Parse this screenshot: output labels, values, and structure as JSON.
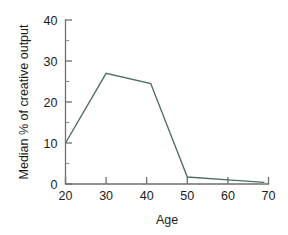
{
  "chart_data": {
    "type": "line",
    "title": "",
    "subtitle": "",
    "xlabel": "Age",
    "ylabel": "Median % of creative output",
    "xlim": [
      20,
      70
    ],
    "ylim": [
      0,
      40
    ],
    "grid": false,
    "legend": false,
    "legend_position": "none",
    "x_ticks": [
      20,
      30,
      40,
      50,
      60,
      70
    ],
    "y_ticks": [
      0,
      10,
      20,
      30,
      40
    ],
    "x_tick_labels": [
      "20",
      "30",
      "40",
      "50",
      "60",
      "70"
    ],
    "y_tick_labels": [
      "0",
      "10",
      "20",
      "30",
      "40"
    ],
    "series": [
      {
        "name": "Median % of creative output",
        "color": "#4c6d65",
        "x": [
          20,
          30,
          41,
          50,
          60,
          69
        ],
        "values": [
          10,
          27,
          24.5,
          1.7,
          1.0,
          0.4
        ]
      }
    ],
    "annotations": []
  },
  "colors": {
    "background": "#ffffff",
    "line": "#4c6d65",
    "axis": "#6f6f6f",
    "text": "#1b1b1b"
  }
}
